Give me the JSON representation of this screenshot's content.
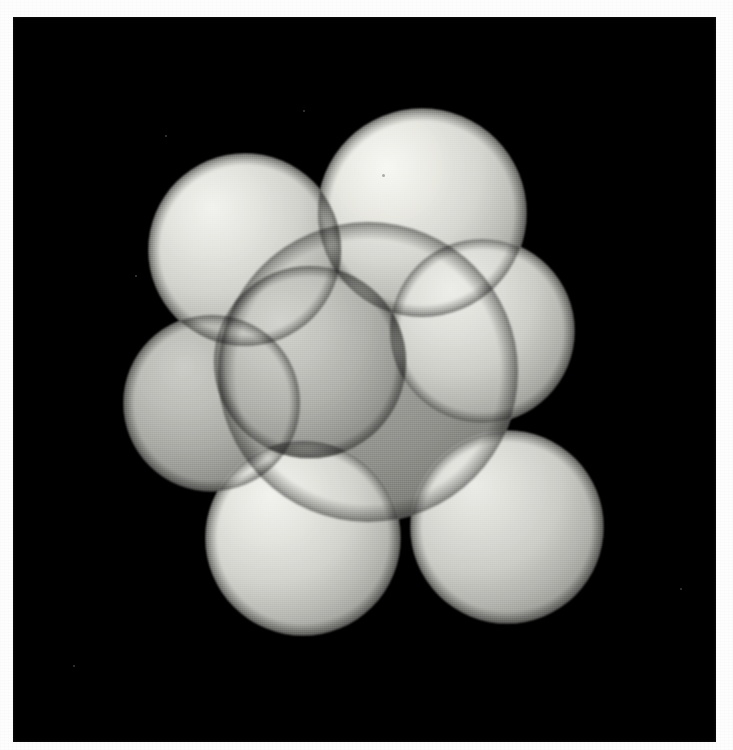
{
  "plate": {
    "width": 733,
    "height": 750,
    "margin_color": "#fdfdfd",
    "canvas_color": "#000000",
    "canvas_rect": {
      "x": 13,
      "y": 17,
      "width": 703,
      "height": 725
    },
    "caption": ""
  },
  "figure": {
    "kind": "space-filling-molecular-model",
    "rendering": "grayscale ray-traced spheres on black background",
    "palette": {
      "background": "#000000",
      "sphere_light": "#e9e9e4",
      "sphere_mid": "#c9c9c4",
      "sphere_dark": "#8e8e8a",
      "core_body": "#b4b4b0",
      "seam": "#a9a9a5",
      "margin": "#fdfdfd"
    },
    "light_source": {
      "azimuth_deg": 315,
      "elevation_deg": 45,
      "description": "upper-left key light"
    },
    "atom_count": 8
  },
  "atoms": [
    {
      "id": "sphere-top-left",
      "label": "top-left sphere",
      "cx": 232,
      "cy": 233,
      "r": 96,
      "tone": "light",
      "shade": 1.0,
      "z": 3
    },
    {
      "id": "sphere-top-right",
      "label": "top-right sphere",
      "cx": 409,
      "cy": 196,
      "r": 104,
      "tone": "light",
      "shade": 1.02,
      "z": 2
    },
    {
      "id": "sphere-right",
      "label": "right sphere",
      "cx": 469,
      "cy": 314,
      "r": 92,
      "tone": "light",
      "shade": 0.98,
      "z": 4
    },
    {
      "id": "sphere-right-lower",
      "label": "lower-right sphere",
      "cx": 494,
      "cy": 510,
      "r": 96,
      "tone": "light",
      "shade": 0.97,
      "z": 4
    },
    {
      "id": "sphere-bottom",
      "label": "bottom-centre sphere",
      "cx": 290,
      "cy": 521,
      "r": 97,
      "tone": "light",
      "shade": 1.0,
      "z": 5
    },
    {
      "id": "sphere-left",
      "label": "left sphere",
      "cx": 199,
      "cy": 386,
      "r": 88,
      "tone": "mid",
      "shade": 0.9,
      "z": 1
    },
    {
      "id": "sphere-front-centre",
      "label": "central front sphere",
      "cx": 297,
      "cy": 345,
      "r": 96,
      "tone": "mid",
      "shade": 0.93,
      "z": 6
    },
    {
      "id": "sphere-core",
      "label": "core body",
      "cx": 355,
      "cy": 355,
      "r": 150,
      "tone": "dark",
      "shade": 0.84,
      "z": 0
    }
  ],
  "specks": [
    {
      "x": 290,
      "y": 93,
      "d": 2
    },
    {
      "x": 667,
      "y": 571,
      "d": 2
    },
    {
      "x": 152,
      "y": 118,
      "d": 2
    },
    {
      "x": 122,
      "y": 258,
      "d": 2
    },
    {
      "x": 369,
      "y": 157,
      "d": 3
    },
    {
      "x": 60,
      "y": 648,
      "d": 2
    }
  ]
}
